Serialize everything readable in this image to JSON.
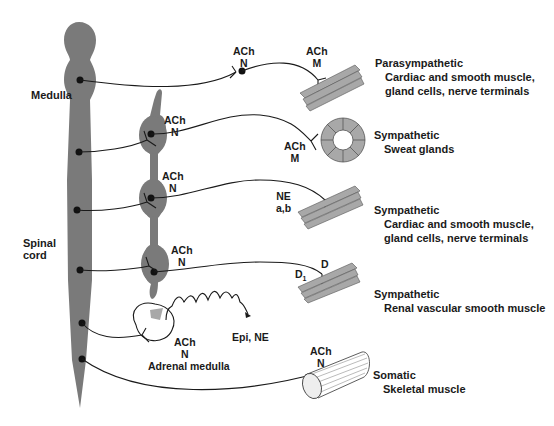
{
  "cns": {
    "medulla_label": "Medulla",
    "spinal_cord_label": "Spinal cord",
    "spinal_line1": "Spinal",
    "spinal_line2": "cord"
  },
  "pathways": [
    {
      "id": "parasympathetic",
      "division": "Parasympathetic",
      "target_line1": "Cardiac and smooth muscle,",
      "target_line2": "gland cells, nerve terminals",
      "ganglion_transmitter": "ACh",
      "ganglion_receptor": "N",
      "effector_transmitter": "ACh",
      "effector_receptor": "M"
    },
    {
      "id": "sympathetic-sweat",
      "division": "Sympathetic",
      "target_line1": "Sweat glands",
      "ganglion_transmitter": "ACh",
      "ganglion_receptor": "N",
      "effector_transmitter": "ACh",
      "effector_receptor": "M"
    },
    {
      "id": "sympathetic-cardiac",
      "division": "Sympathetic",
      "target_line1": "Cardiac and smooth muscle,",
      "target_line2": "gland cells, nerve terminals",
      "ganglion_transmitter": "ACh",
      "ganglion_receptor": "N",
      "effector_transmitter": "NE",
      "effector_receptor": "a,b"
    },
    {
      "id": "sympathetic-renal",
      "division": "Sympathetic",
      "target_line1": "Renal vascular smooth muscle",
      "ganglion_transmitter": "ACh",
      "ganglion_receptor": "N",
      "effector_transmitter": "D",
      "effector_receptor": "D",
      "effector_receptor_sub": "1"
    },
    {
      "id": "adrenal",
      "organ_label": "Adrenal medulla",
      "ganglion_transmitter": "ACh",
      "ganglion_receptor": "N",
      "released": "Epi, NE"
    },
    {
      "id": "somatic",
      "division": "Somatic",
      "target_line1": "Skeletal muscle",
      "effector_transmitter": "ACh",
      "effector_receptor": "N"
    }
  ],
  "colors": {
    "tissue": "#7a7a7a",
    "tissue_light": "#a8a8a8",
    "line": "#1a1a1a",
    "text": "#1a1a1a"
  }
}
